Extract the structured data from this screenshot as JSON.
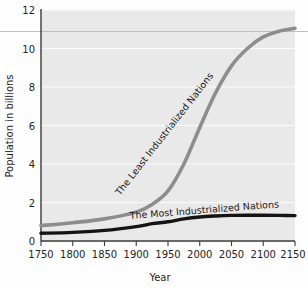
{
  "chart_data": {
    "type": "line",
    "title": "",
    "xlabel": "Year",
    "ylabel": "Population in billions",
    "xlim": [
      1750,
      2150
    ],
    "ylim": [
      0,
      12
    ],
    "grid": true,
    "legend_position": "inline-curve-labels",
    "x_ticks": [
      1750,
      1800,
      1850,
      1900,
      1950,
      2000,
      2050,
      2100,
      2150
    ],
    "y_ticks": [
      0,
      2,
      4,
      6,
      8,
      10,
      12
    ],
    "annotations": [
      {
        "name": "world-ceiling-reference-line",
        "y": 10.9,
        "style": "thin-horizontal-line"
      }
    ],
    "series": [
      {
        "name": "The Least Industrialized Nations",
        "color": "#8d8d8d",
        "label_rotation_deg": -52,
        "x": [
          1750,
          1800,
          1850,
          1900,
          1925,
          1950,
          1975,
          2000,
          2025,
          2050,
          2075,
          2100,
          2125,
          2150
        ],
        "values": [
          0.8,
          0.95,
          1.15,
          1.5,
          1.9,
          2.6,
          4.0,
          5.9,
          7.7,
          9.1,
          10.0,
          10.6,
          10.9,
          11.05
        ]
      },
      {
        "name": "The Most Industrialized Nations",
        "color": "#141414",
        "label_rotation_deg": -5,
        "x": [
          1750,
          1800,
          1850,
          1900,
          1925,
          1950,
          1975,
          2000,
          2025,
          2050,
          2075,
          2100,
          2125,
          2150
        ],
        "values": [
          0.4,
          0.45,
          0.55,
          0.75,
          0.9,
          1.0,
          1.15,
          1.25,
          1.3,
          1.33,
          1.34,
          1.34,
          1.33,
          1.32
        ]
      }
    ]
  },
  "axes": {
    "y_label": "Population in billions",
    "x_label": "Year",
    "y_tick_labels": [
      "0",
      "2",
      "4",
      "6",
      "8",
      "10",
      "12"
    ],
    "x_tick_labels": [
      "1750",
      "1800",
      "1850",
      "1900",
      "1950",
      "2000",
      "2050",
      "2100",
      "2150"
    ]
  },
  "labels": {
    "least": "The Least Industrialized Nations",
    "most": "The Most Industrialized Nations"
  },
  "colors": {
    "plot_background": "#e9e9e9",
    "page_background": "#fdfdfd",
    "gridline": "#fbfbfb",
    "axis": "#3a3a3a",
    "least_series": "#8d8d8d",
    "most_series": "#141414",
    "reference_line": "#b9b9b9",
    "text": "#242424"
  }
}
